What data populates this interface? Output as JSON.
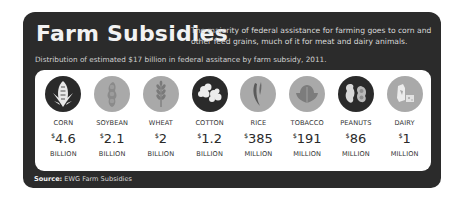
{
  "header": {
    "title": "Farm Subsidies",
    "description": "The majority of federal assistance for farming goes to corn and other feed grains, much of it for meat and dairy animals.",
    "subtitle": "Distribution of estimated $17 billion in federal assitance by farm subsidy, 2011."
  },
  "items": [
    {
      "name": "CORN",
      "currency": "$",
      "amount": "4.6",
      "unit": "BILLION",
      "icon": "corn-icon",
      "style": "dark"
    },
    {
      "name": "SOYBEAN",
      "currency": "$",
      "amount": "2.1",
      "unit": "BILLION",
      "icon": "soybean-icon",
      "style": "light"
    },
    {
      "name": "WHEAT",
      "currency": "$",
      "amount": "2",
      "unit": "BILLION",
      "icon": "wheat-icon",
      "style": "light"
    },
    {
      "name": "COTTON",
      "currency": "$",
      "amount": "1.2",
      "unit": "BILLION",
      "icon": "cotton-icon",
      "style": "dark"
    },
    {
      "name": "RICE",
      "currency": "$",
      "amount": "385",
      "unit": "MILLION",
      "icon": "rice-icon",
      "style": "light"
    },
    {
      "name": "TOBACCO",
      "currency": "$",
      "amount": "191",
      "unit": "MILLION",
      "icon": "tobacco-icon",
      "style": "light"
    },
    {
      "name": "PEANUTS",
      "currency": "$",
      "amount": "86",
      "unit": "MILLION",
      "icon": "peanut-icon",
      "style": "dark"
    },
    {
      "name": "DAIRY",
      "currency": "$",
      "amount": "1",
      "unit": "MILLION",
      "icon": "dairy-icon",
      "style": "light"
    }
  ],
  "footer": {
    "source_label": "Source:",
    "source_text": " EWG Farm Subsidies"
  },
  "colors": {
    "card_bg": "#2b2b2b",
    "panel_bg": "#ffffff",
    "icon_dark": "#2a2a2a",
    "icon_light": "#a9a9a9"
  }
}
